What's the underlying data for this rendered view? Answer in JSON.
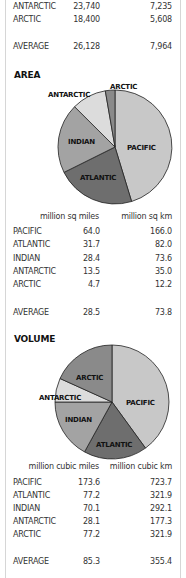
{
  "depth_table": {
    "rows": [
      {
        "name": "ANTARCTIC",
        "feet": "23,740",
        "meters": "7,235"
      },
      {
        "name": "ARCTIC",
        "feet": "18,400",
        "meters": "5,608"
      }
    ],
    "average": {
      "name": "AVERAGE",
      "feet": "26,128",
      "meters": "7,964"
    }
  },
  "area": {
    "heading": "AREA",
    "unit1": "million sq miles",
    "unit2": "million sq km",
    "rows": [
      {
        "name": "PACIFIC",
        "v1": "64.0",
        "v2": "166.0"
      },
      {
        "name": "ATLANTIC",
        "v1": "31.7",
        "v2": "82.0"
      },
      {
        "name": "INDIAN",
        "v1": "28.4",
        "v2": "73.6"
      },
      {
        "name": "ANTARCTIC",
        "v1": "13.5",
        "v2": "35.0"
      },
      {
        "name": "ARCTIC",
        "v1": "4.7",
        "v2": "12.2"
      }
    ],
    "average": {
      "name": "AVERAGE",
      "v1": "28.5",
      "v2": "73.8"
    }
  },
  "volume": {
    "heading": "VOLUME",
    "unit1": "million cubic miles",
    "unit2": "million cubic km",
    "rows": [
      {
        "name": "PACIFIC",
        "v1": "173.6",
        "v2": "723.7"
      },
      {
        "name": "ATLANTIC",
        "v1": "77.2",
        "v2": "321.9"
      },
      {
        "name": "INDIAN",
        "v1": "70.1",
        "v2": "292.1"
      },
      {
        "name": "ANTARCTIC",
        "v1": "28.1",
        "v2": "177.3"
      },
      {
        "name": "ARCTIC",
        "v1": "77.2",
        "v2": "321.9"
      }
    ],
    "average": {
      "name": "AVERAGE",
      "v1": "85.3",
      "v2": "355.4"
    }
  },
  "pie_labels": {
    "pacific": "PACIFIC",
    "atlantic": "ATLANTIC",
    "indian": "INDIAN",
    "antarctic": "ANTARCTIC",
    "arctic": "ARCTIC"
  },
  "colors": {
    "pacific": "#c8c8c8",
    "atlantic": "#6e6e6e",
    "indian": "#a3a3a3",
    "antarctic": "#dcdcdc",
    "arctic": "#8a8a8a",
    "outline": "#222222"
  }
}
